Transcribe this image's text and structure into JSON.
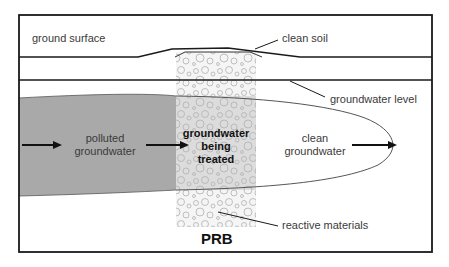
{
  "diagram": {
    "labels": {
      "ground_surface": "ground surface",
      "clean_soil": "clean soil",
      "groundwater_level": "groundwater level",
      "polluted_line1": "polluted",
      "polluted_line2": "groundwater",
      "treated_line1": "groundwater",
      "treated_line2": "being",
      "treated_line3": "treated",
      "clean_line1": "clean",
      "clean_line2": "groundwater",
      "reactive_materials": "reactive materials",
      "prb": "PRB"
    },
    "colors": {
      "frame": "#1a1a1a",
      "polluted_fill": "#a9a9a9",
      "prb_fill": "#e6e6e6",
      "pellet_stroke": "#b5b5b5",
      "plume_outline": "#555555",
      "text": "#3a3a3a"
    },
    "flow_direction": "left-to-right"
  }
}
